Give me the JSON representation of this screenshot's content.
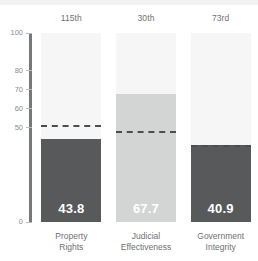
{
  "chart_data": {
    "type": "bar",
    "title": "",
    "subtitle": "",
    "xlabel": "",
    "ylabel": "",
    "ylim": [
      0,
      100
    ],
    "grid": false,
    "legend": "none",
    "y_ticks": [
      {
        "value": 100,
        "label": "100"
      },
      {
        "value": 80,
        "label": "80"
      },
      {
        "value": 70,
        "label": "70"
      },
      {
        "value": 60,
        "label": "60"
      },
      {
        "value": 50,
        "label": "50"
      },
      {
        "value": 0,
        "label": "0"
      }
    ],
    "categories": [
      "Property Rights",
      "Judicial Effectiveness",
      "Government Integrity"
    ],
    "category_lines": [
      [
        "Property",
        "Rights"
      ],
      [
        "Judicial",
        "Effectiveness"
      ],
      [
        "Government",
        "Integrity"
      ]
    ],
    "values": [
      43.8,
      67.7,
      40.9
    ],
    "value_labels": [
      "43.8",
      "67.7",
      "40.9"
    ],
    "rank_labels": [
      "115th",
      "30th",
      "73rd"
    ],
    "reference_lines": [
      51.5,
      48.0,
      41.0
    ],
    "series": [
      {
        "name": "Score",
        "values": [
          43.8,
          67.7,
          40.9
        ]
      },
      {
        "name": "World Average",
        "values": [
          51.5,
          48.0,
          41.0
        ],
        "style": "dashed"
      }
    ],
    "bar_colors": [
      "#58595b",
      "#d3d4d4",
      "#58595b"
    ],
    "value_label_colors": [
      "#ffffff",
      "#ffffff",
      "#ffffff"
    ],
    "track_color": "#f6f6f6",
    "axis_color": "#77787a",
    "reference_line_color": "#4c4d4f",
    "tick_label_color": "#8a8b8d",
    "caption_color": "#6f7072"
  }
}
